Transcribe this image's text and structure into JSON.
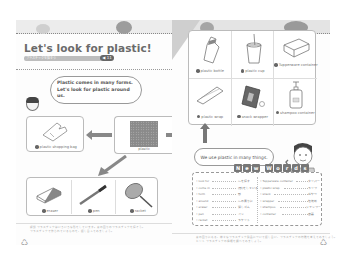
{
  "left_page": {
    "title": "Let's look for plastic!",
    "subtitle_bar": "プラスチックを探そう",
    "track_badge": "◀ 11",
    "speech_bubble": {
      "line1": "Plastic comes in many forms.",
      "line2": "Let's look for plastic around us."
    },
    "center_item": "plastic",
    "top_items": [
      {
        "num": "1",
        "label": "plastic shopping bag"
      }
    ],
    "bottom_items": [
      {
        "num": "2",
        "label": "eraser"
      },
      {
        "num": "3",
        "label": "pen"
      },
      {
        "num": "4",
        "label": "racket"
      }
    ],
    "footnote_line1": "解説 プラスチックはいろいろな形をしています。身の回りのプラスチックを探そう。",
    "footnote_line2": "プラスチックで作られているものを、話し合ってみましょう。"
  },
  "right_page": {
    "grid_items": [
      {
        "num": "5",
        "label": "plastic bottle"
      },
      {
        "num": "6",
        "label": "plastic cup"
      },
      {
        "num": "7",
        "label": "Tupperware container"
      },
      {
        "num": "8",
        "label": "plastic wrap"
      },
      {
        "num": "9",
        "label": "snack wrapper"
      },
      {
        "num": "10",
        "label": "shampoo container"
      }
    ],
    "speech_bubble": "We use plastic in many things.",
    "new_words_title": [
      "N",
      "e",
      "w",
      "W",
      "o",
      "r",
      "d",
      "s"
    ],
    "cd_badge": "CD",
    "vocab_left": [
      {
        "en": "look for",
        "jp": "〜を探す"
      },
      {
        "en": "come in",
        "jp": "(形)をしている"
      },
      {
        "en": "form",
        "jp": "形"
      },
      {
        "en": "around",
        "jp": "〜の周りに"
      },
      {
        "en": "eraser",
        "jp": "消しゴム"
      },
      {
        "en": "pen",
        "jp": "ペン"
      },
      {
        "en": "racket",
        "jp": "ラケット"
      }
    ],
    "vocab_right": [
      {
        "en": "Tupperware container",
        "jp": "タッパー"
      },
      {
        "en": "plastic wrap",
        "jp": "ラップ"
      },
      {
        "en": "snack",
        "jp": "おやつ"
      },
      {
        "en": "wrapper",
        "jp": "包装紙"
      },
      {
        "en": "shampoo",
        "jp": "シャンプー"
      },
      {
        "en": "container",
        "jp": "容器"
      }
    ],
    "footnote_line1": "身の回りにある、様々なプラスチック製品について話し合い、プラスチックの特徴を考えてみましょう。",
    "footnote_line2": "ヒント プラスチックの種類を調べてみましょう。"
  },
  "icons": {
    "recycle": "♺"
  }
}
